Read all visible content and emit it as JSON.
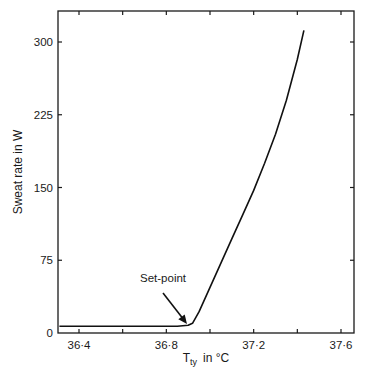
{
  "chart_data": {
    "type": "line",
    "title": "",
    "xlabel": "T_ty in °C",
    "xlabel_main": "T",
    "xlabel_sub": "ty",
    "xlabel_unit": "in °C",
    "ylabel": "Sweat rate in W",
    "xlim": [
      36.3,
      37.65
    ],
    "ylim": [
      0,
      335
    ],
    "x_ticks": [
      36.4,
      36.6,
      36.8,
      37.0,
      37.2,
      37.4,
      37.6
    ],
    "x_tick_labels": [
      "36·4",
      "",
      "36·8",
      "",
      "37·2",
      "",
      "37·6"
    ],
    "y_ticks": [
      0,
      75,
      150,
      225,
      300
    ],
    "y_tick_labels": [
      "0",
      "75",
      "150",
      "225",
      "300"
    ],
    "grid": false,
    "legend": null,
    "series": [
      {
        "name": "Sweat rate",
        "x": [
          36.31,
          36.5,
          36.7,
          36.85,
          36.9,
          36.92,
          36.95,
          37.0,
          37.05,
          37.1,
          37.15,
          37.2,
          37.25,
          37.3,
          37.35,
          37.4,
          37.43
        ],
        "y": [
          7,
          7,
          7,
          7,
          8,
          10,
          22,
          47,
          72,
          97,
          122,
          147,
          175,
          205,
          240,
          282,
          312
        ]
      }
    ],
    "annotations": [
      {
        "text": "Set-point",
        "x": 36.9,
        "y": 65,
        "arrow_to": [
          36.91,
          9
        ]
      }
    ]
  }
}
